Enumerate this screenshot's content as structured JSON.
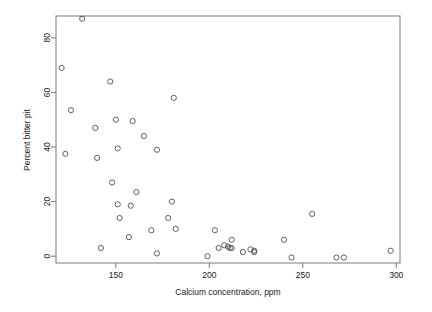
{
  "chart_data": {
    "type": "scatter",
    "title": "",
    "xlabel": "Calcium concentration, ppm",
    "ylabel": "Percent bitter pit",
    "xlim": [
      118,
      302
    ],
    "ylim": [
      -2.5,
      88
    ],
    "xticks": [
      150,
      200,
      250,
      300
    ],
    "yticks": [
      0,
      20,
      40,
      60,
      80
    ],
    "xtick_labels": [
      "150",
      "200",
      "250",
      "300"
    ],
    "ytick_labels": [
      "0",
      "20",
      "40",
      "60",
      "80"
    ],
    "grid": false,
    "legend": null,
    "marker": "open-circle",
    "marker_color": "#4d4d57",
    "box_frame": true,
    "points": [
      {
        "x": 132,
        "y": 87.0
      },
      {
        "x": 121,
        "y": 69.0
      },
      {
        "x": 126,
        "y": 53.5
      },
      {
        "x": 147,
        "y": 64.0
      },
      {
        "x": 139,
        "y": 47.0
      },
      {
        "x": 150,
        "y": 50.0
      },
      {
        "x": 159,
        "y": 49.5
      },
      {
        "x": 181,
        "y": 58.0
      },
      {
        "x": 165,
        "y": 44.0
      },
      {
        "x": 123,
        "y": 37.5
      },
      {
        "x": 140,
        "y": 36.0
      },
      {
        "x": 151,
        "y": 39.5
      },
      {
        "x": 172,
        "y": 39.0
      },
      {
        "x": 148,
        "y": 27.0
      },
      {
        "x": 161,
        "y": 23.5
      },
      {
        "x": 151,
        "y": 19.0
      },
      {
        "x": 158,
        "y": 18.5
      },
      {
        "x": 180,
        "y": 20.0
      },
      {
        "x": 152,
        "y": 14.0
      },
      {
        "x": 178,
        "y": 14.0
      },
      {
        "x": 255,
        "y": 15.5
      },
      {
        "x": 157,
        "y": 7.0
      },
      {
        "x": 169,
        "y": 9.5
      },
      {
        "x": 182,
        "y": 10.0
      },
      {
        "x": 203,
        "y": 9.5
      },
      {
        "x": 142,
        "y": 3.0
      },
      {
        "x": 172,
        "y": 1.0
      },
      {
        "x": 199,
        "y": 0.0
      },
      {
        "x": 205,
        "y": 3.0
      },
      {
        "x": 208,
        "y": 4.0
      },
      {
        "x": 210,
        "y": 3.5
      },
      {
        "x": 211,
        "y": 3.0
      },
      {
        "x": 212,
        "y": 3.0
      },
      {
        "x": 212,
        "y": 6.0
      },
      {
        "x": 218,
        "y": 1.5
      },
      {
        "x": 222,
        "y": 2.5
      },
      {
        "x": 224,
        "y": 2.0
      },
      {
        "x": 224,
        "y": 1.5
      },
      {
        "x": 240,
        "y": 6.0
      },
      {
        "x": 244,
        "y": -0.5
      },
      {
        "x": 268,
        "y": -0.5
      },
      {
        "x": 272,
        "y": -0.5
      },
      {
        "x": 297,
        "y": 2.0
      }
    ]
  }
}
